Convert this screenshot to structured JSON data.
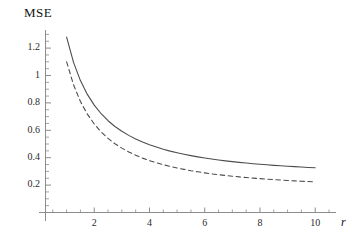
{
  "figure": {
    "title": "MSE",
    "background_color": "#ffffff",
    "line_color": "#4d4d4d",
    "axis_color": "#8a8a8a"
  },
  "chart_data": {
    "type": "line",
    "title": "MSE",
    "xlabel": "r",
    "ylabel": "MSE",
    "xlim": [
      0,
      10.6
    ],
    "ylim": [
      0,
      1.33
    ],
    "grid": false,
    "legend": null,
    "x_ticks": [
      2,
      4,
      6,
      8,
      10
    ],
    "x_tick_labels": [
      "2",
      "4",
      "6",
      "8",
      "10"
    ],
    "x_minor_ticks": [
      0.5,
      1,
      1.5,
      2.5,
      3,
      3.5,
      4.5,
      5,
      5.5,
      6.5,
      7,
      7.5,
      8.5,
      9,
      9.5,
      10.5
    ],
    "y_ticks": [
      0.2,
      0.4,
      0.6,
      0.8,
      1.0,
      1.2
    ],
    "y_tick_labels": [
      "0.2",
      "0.4",
      "0.6",
      "0.8",
      "1",
      "1.2"
    ],
    "y_minor_ticks": [
      0.05,
      0.1,
      0.15,
      0.25,
      0.3,
      0.35,
      0.45,
      0.5,
      0.55,
      0.65,
      0.7,
      0.75,
      0.85,
      0.9,
      0.95,
      1.05,
      1.1,
      1.15,
      1.25,
      1.3
    ],
    "x": [
      1,
      1.25,
      1.5,
      1.75,
      2,
      2.25,
      2.5,
      2.75,
      3,
      3.25,
      3.5,
      3.75,
      4,
      4.25,
      4.5,
      4.75,
      5,
      5.25,
      5.5,
      5.75,
      6,
      6.25,
      6.5,
      6.75,
      7,
      7.25,
      7.5,
      7.75,
      8,
      8.25,
      8.5,
      8.75,
      9,
      9.25,
      9.5,
      9.75,
      10
    ],
    "series": [
      {
        "name": "solid-curve",
        "style": "solid",
        "values": [
          1.28,
          1.096,
          0.963,
          0.862,
          0.784,
          0.721,
          0.67,
          0.628,
          0.593,
          0.563,
          0.537,
          0.515,
          0.495,
          0.478,
          0.462,
          0.448,
          0.436,
          0.425,
          0.415,
          0.406,
          0.398,
          0.39,
          0.383,
          0.377,
          0.371,
          0.366,
          0.361,
          0.356,
          0.352,
          0.348,
          0.344,
          0.341,
          0.338,
          0.335,
          0.332,
          0.329,
          0.327
        ]
      },
      {
        "name": "dashed-curve",
        "style": "dashed",
        "values": [
          1.1,
          0.932,
          0.81,
          0.718,
          0.646,
          0.588,
          0.541,
          0.502,
          0.47,
          0.442,
          0.418,
          0.397,
          0.379,
          0.363,
          0.349,
          0.336,
          0.325,
          0.315,
          0.305,
          0.297,
          0.289,
          0.282,
          0.276,
          0.27,
          0.265,
          0.26,
          0.255,
          0.251,
          0.247,
          0.243,
          0.24,
          0.237,
          0.234,
          0.231,
          0.228,
          0.226,
          0.223
        ]
      }
    ]
  }
}
